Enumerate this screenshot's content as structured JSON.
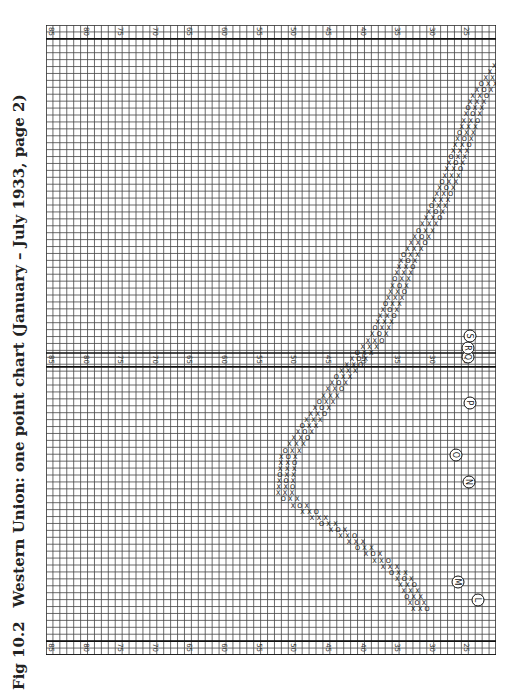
{
  "figure": {
    "number": "Fig 10.2",
    "caption": "Western Union: one point chart (January – July 1933, page 2)"
  },
  "chart_data": {
    "type": "point-and-figure",
    "title": "Western Union: one point chart (January – July 1933, page 2)",
    "orientation": "rotated 90 degrees clockwise on the page",
    "box_size": 1,
    "price_axis": {
      "labels": [
        "85",
        "80",
        "75",
        "70",
        "65",
        "60",
        "55",
        "50",
        "45",
        "40",
        "35",
        "30",
        "25",
        "20"
      ],
      "range": [
        85,
        20
      ],
      "label_step": 5
    },
    "grid": true,
    "symbols": [
      "X",
      "O"
    ],
    "annotations": {
      "circled_letters": [
        "L",
        "M",
        "N",
        "O",
        "P",
        "Q",
        "R",
        "S"
      ],
      "arrows": "vertical arrows marking breakouts"
    },
    "price_path_estimate": [
      {
        "col": 1,
        "low": 18.5,
        "high": 21
      },
      {
        "col": 5,
        "low": 21,
        "high": 25
      },
      {
        "col": 10,
        "low": 22,
        "high": 28
      },
      {
        "col": 15,
        "low": 24,
        "high": 30
      },
      {
        "col": 20,
        "low": 26,
        "high": 33
      },
      {
        "col": 25,
        "low": 29,
        "high": 37
      },
      {
        "col": 30,
        "low": 32,
        "high": 38
      },
      {
        "col": 35,
        "low": 35,
        "high": 40
      },
      {
        "col": 40,
        "low": 38,
        "high": 47
      },
      {
        "col": 45,
        "low": 40,
        "high": 53
      },
      {
        "col": 50,
        "low": 47,
        "high": 54
      },
      {
        "col": 55,
        "low": 47,
        "high": 55
      },
      {
        "col": 60,
        "low": 36,
        "high": 48
      },
      {
        "col": 65,
        "low": 32,
        "high": 36
      },
      {
        "col": 70,
        "low": 29,
        "high": 33
      }
    ]
  }
}
